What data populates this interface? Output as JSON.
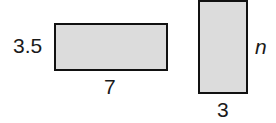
{
  "figure": {
    "rectangles": [
      {
        "id": "rectangle-a",
        "height_label": "3.5",
        "width_label": "7",
        "fill_color": "#dcdcdc",
        "border_color": "#111111"
      },
      {
        "id": "rectangle-b",
        "height_label": "n",
        "width_label": "3",
        "fill_color": "#dcdcdc",
        "border_color": "#111111"
      }
    ]
  }
}
